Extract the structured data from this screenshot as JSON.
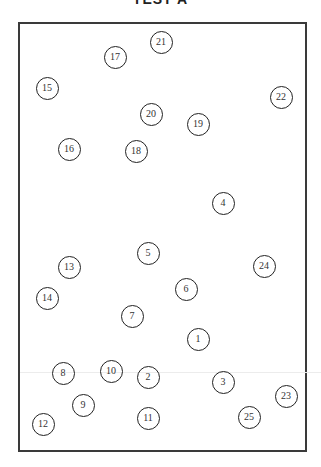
{
  "header": {
    "title": "TEST A"
  },
  "colors": {
    "frame": "#3a3a3a",
    "circle_stroke": "#222222",
    "text": "#333333",
    "background": "#ffffff"
  },
  "circles": [
    {
      "label": "1",
      "x": 198,
      "y": 339
    },
    {
      "label": "2",
      "x": 148,
      "y": 377
    },
    {
      "label": "3",
      "x": 223,
      "y": 382
    },
    {
      "label": "4",
      "x": 223,
      "y": 203
    },
    {
      "label": "5",
      "x": 148,
      "y": 253
    },
    {
      "label": "6",
      "x": 186,
      "y": 289
    },
    {
      "label": "7",
      "x": 132,
      "y": 316
    },
    {
      "label": "8",
      "x": 63,
      "y": 373
    },
    {
      "label": "9",
      "x": 83,
      "y": 405
    },
    {
      "label": "10",
      "x": 111,
      "y": 371
    },
    {
      "label": "11",
      "x": 148,
      "y": 418
    },
    {
      "label": "12",
      "x": 43,
      "y": 424
    },
    {
      "label": "13",
      "x": 69,
      "y": 267
    },
    {
      "label": "14",
      "x": 47,
      "y": 298
    },
    {
      "label": "15",
      "x": 47,
      "y": 88
    },
    {
      "label": "16",
      "x": 69,
      "y": 149
    },
    {
      "label": "17",
      "x": 115,
      "y": 57
    },
    {
      "label": "18",
      "x": 136,
      "y": 151
    },
    {
      "label": "19",
      "x": 198,
      "y": 124
    },
    {
      "label": "20",
      "x": 151,
      "y": 114
    },
    {
      "label": "21",
      "x": 161,
      "y": 42
    },
    {
      "label": "22",
      "x": 281,
      "y": 97
    },
    {
      "label": "23",
      "x": 286,
      "y": 396
    },
    {
      "label": "24",
      "x": 264,
      "y": 266
    },
    {
      "label": "25",
      "x": 249,
      "y": 417
    }
  ]
}
